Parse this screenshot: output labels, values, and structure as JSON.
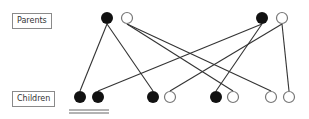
{
  "labels": {
    "parents": "Parents",
    "children": "Children"
  },
  "parents": [
    {
      "id": "p1a",
      "affected": true
    },
    {
      "id": "p1b",
      "affected": false
    },
    {
      "id": "p2a",
      "affected": true
    },
    {
      "id": "p2b",
      "affected": false
    }
  ],
  "children": [
    {
      "id": "c1",
      "affected": true
    },
    {
      "id": "c2",
      "affected": true
    },
    {
      "id": "c3",
      "affected": true
    },
    {
      "id": "c4",
      "affected": false
    },
    {
      "id": "c5",
      "affected": true
    },
    {
      "id": "c6",
      "affected": false
    },
    {
      "id": "c7",
      "affected": false
    },
    {
      "id": "c8",
      "affected": false
    }
  ],
  "links": [
    {
      "from": "p1a",
      "to": "c1"
    },
    {
      "from": "p1a",
      "to": "c3"
    },
    {
      "from": "p1b",
      "to": "c6"
    },
    {
      "from": "p1b",
      "to": "c7"
    },
    {
      "from": "p2a",
      "to": "c2"
    },
    {
      "from": "p2a",
      "to": "c5"
    },
    {
      "from": "p2b",
      "to": "c4"
    },
    {
      "from": "p2b",
      "to": "c8"
    }
  ],
  "underlined_children": [
    "c1",
    "c2"
  ],
  "colors": {
    "affected": "#111111",
    "unaffected_stroke": "#777777",
    "line": "#333333"
  }
}
